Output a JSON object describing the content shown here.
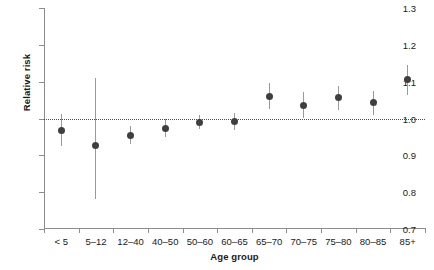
{
  "chart_data": {
    "type": "scatter",
    "title": "",
    "subtitle": "",
    "xlabel": "Age group",
    "ylabel": "Relative risk",
    "ylim": [
      0.7,
      1.3
    ],
    "ytick_labels": [
      "0.7",
      "0.8",
      "0.9",
      "1.0",
      "1.1",
      "1.2",
      "1.3"
    ],
    "ytick_values": [
      0.7,
      0.8,
      0.9,
      1.0,
      1.1,
      1.2,
      1.3
    ],
    "grid": false,
    "legend": "none",
    "reference_line": 1.0,
    "reference_line_style": "dotted",
    "categories": [
      "< 5",
      "5–12",
      "12–40",
      "40–50",
      "50–60",
      "60–65",
      "65–70",
      "70–75",
      "75–80",
      "80–85",
      "85+"
    ],
    "values": [
      0.967,
      0.928,
      0.955,
      0.972,
      0.99,
      0.991,
      1.061,
      1.036,
      1.056,
      1.043,
      1.105
    ],
    "ci_low": [
      0.925,
      0.781,
      0.932,
      0.949,
      0.972,
      0.969,
      1.026,
      1.0,
      1.023,
      1.01,
      1.065
    ],
    "ci_high": [
      1.011,
      1.111,
      0.979,
      1.0,
      1.01,
      1.015,
      1.096,
      1.071,
      1.089,
      1.076,
      1.146
    ],
    "marker": "filled-circle",
    "marker_color": "#3f3f3f",
    "errorbar_color": "#9a9a9a",
    "axis_color": "#8c8c8c",
    "text_color": "#1a1a1a",
    "background": "#ffffff"
  }
}
